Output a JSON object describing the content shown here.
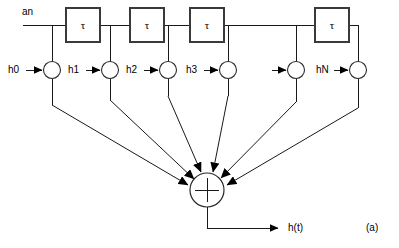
{
  "figure": {
    "caption": "(a)",
    "input_label": "an",
    "output_label": "h(t)",
    "delay_symbol": "τ",
    "sum_symbol": "+",
    "line_color": "#1a1a1a",
    "box_stroke_color": "#3a3a3a",
    "background_color": "#ffffff"
  },
  "delay_boxes": [
    {
      "label": "τ",
      "x": 66,
      "y": 8,
      "w": 34,
      "h": 34
    },
    {
      "label": "τ",
      "x": 130,
      "y": 8,
      "w": 34,
      "h": 34
    },
    {
      "label": "τ",
      "x": 190,
      "y": 8,
      "w": 34,
      "h": 34
    },
    {
      "label": "τ",
      "x": 315,
      "y": 8,
      "w": 34,
      "h": 34
    }
  ],
  "taps": [
    {
      "label": "h0",
      "cx": 52,
      "cy": 70,
      "has_label": true
    },
    {
      "label": "h1",
      "cx": 110,
      "cy": 70,
      "has_label": true
    },
    {
      "label": "h2",
      "cx": 168,
      "cy": 70,
      "has_label": true
    },
    {
      "label": "h3",
      "cx": 228,
      "cy": 70,
      "has_label": true
    },
    {
      "label": "",
      "cx": 296,
      "cy": 70,
      "has_label": false
    },
    {
      "label": "hN",
      "cx": 358,
      "cy": 70,
      "has_label": true
    }
  ],
  "summer": {
    "cx": 207,
    "cy": 190,
    "r": 17,
    "symbol": "+",
    "incoming_count": 6
  },
  "output": {
    "label": "h(t)",
    "arrow_x": 283,
    "line_y": 228
  }
}
